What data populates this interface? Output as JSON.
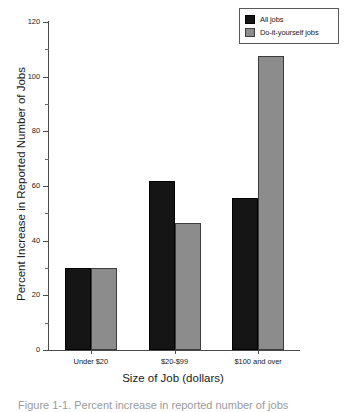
{
  "chart_data": {
    "type": "bar",
    "title": "",
    "xlabel": "Size of Job (dollars)",
    "ylabel": "Percent Increase in Reported Number of Jobs",
    "categories": [
      "Under $20",
      "$20-$99",
      "$100 and over"
    ],
    "series": [
      {
        "name": "All jobs",
        "color": "#151515",
        "values": [
          30,
          62,
          55.5
        ]
      },
      {
        "name": "Do-it-yourself jobs",
        "color": "#8c8c8c",
        "values": [
          30,
          46.5,
          107.5
        ]
      }
    ],
    "ylim": [
      0,
      120
    ],
    "ytick_labels": [
      "0",
      "20",
      "40",
      "60",
      "80",
      "100",
      "120"
    ],
    "ytick_values": [
      0,
      20,
      40,
      60,
      80,
      100,
      120
    ],
    "yminor_step": 10,
    "grid": false,
    "legend_position": "top-right"
  },
  "legend": {
    "items": [
      {
        "label": "All jobs",
        "swatch": "dark"
      },
      {
        "label": "Do-it-yourself jobs",
        "swatch": "gray"
      }
    ]
  },
  "caption": {
    "text": "Figure 1-1. Percent increase in reported number of jobs"
  }
}
